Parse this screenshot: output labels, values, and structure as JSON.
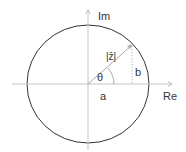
{
  "diagram": {
    "labels": {
      "imaginary_axis": "Im",
      "real_axis": "Re",
      "magnitude": "|z̄|",
      "opposite_side": "b",
      "angle": "θ",
      "adjacent_side": "a"
    },
    "colors": {
      "circle": "#333333",
      "axes": "#bbbbbb",
      "vector": "#aaaaaa",
      "text": "#333333"
    }
  }
}
